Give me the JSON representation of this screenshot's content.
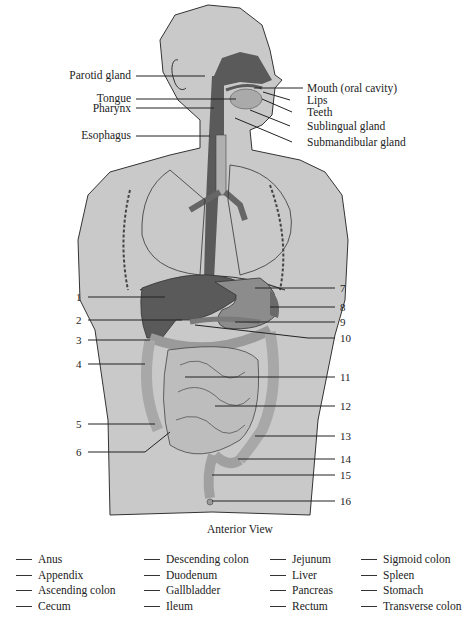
{
  "figure": {
    "caption": "Anterior View",
    "colors": {
      "body": "#c9c9c9",
      "organ_dark": "#5a5a5a",
      "organ_mid": "#8c8c8c",
      "intestine": "#b5b5b5",
      "outline": "#333333",
      "leader": "#222222"
    },
    "left_labels": [
      {
        "text": "Parotid gland"
      },
      {
        "text": "Tongue"
      },
      {
        "text": "Pharynx"
      },
      {
        "text": "Esophagus"
      }
    ],
    "right_labels": [
      {
        "text": "Mouth (oral cavity)"
      },
      {
        "text": "Lips"
      },
      {
        "text": "Teeth"
      },
      {
        "text": "Sublingual gland"
      },
      {
        "text": "Submandibular gland"
      }
    ],
    "left_numbers": [
      "1",
      "2",
      "3",
      "4",
      "5",
      "6"
    ],
    "right_numbers": [
      "7",
      "8",
      "9",
      "10",
      "11",
      "12",
      "13",
      "14",
      "15",
      "16"
    ]
  },
  "answer_key": {
    "columns": [
      [
        "Anus",
        "Appendix",
        "Ascending colon",
        "Cecum"
      ],
      [
        "Descending colon",
        "Duodenum",
        "Gallbladder",
        "Ileum"
      ],
      [
        "Jejunum",
        "Liver",
        "Pancreas",
        "Rectum"
      ],
      [
        "Sigmoid colon",
        "Spleen",
        "Stomach",
        "Transverse colon"
      ]
    ]
  }
}
